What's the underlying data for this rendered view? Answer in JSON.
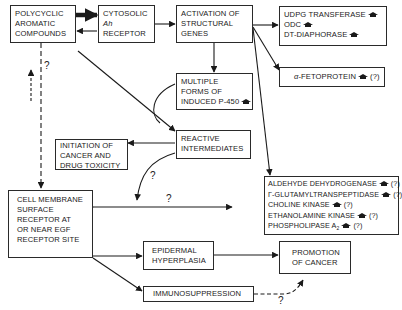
{
  "diagram": {
    "nodes": {
      "pah": {
        "lines": [
          "POLYCYCLIC",
          "AROMATIC",
          "COMPOUNDS"
        ]
      },
      "ah_receptor": {
        "line1": "CYTOSOLIC",
        "line2": "Ah",
        "line3": "RECEPTOR"
      },
      "activation": {
        "lines": [
          "ACTIVATION OF",
          "STRUCTURAL",
          "GENES"
        ]
      },
      "enzymes_top": {
        "items": [
          {
            "label": "UDPG TRANSFERASE",
            "increase": true,
            "uncertain": false
          },
          {
            "label": "ODC",
            "increase": true,
            "uncertain": false
          },
          {
            "label": "DT-DIAPHORASE",
            "increase": true,
            "uncertain": false
          }
        ]
      },
      "fetoprotein": {
        "prefix": "α",
        "label": "-FETOPROTEIN",
        "uncertain_mark": "(?)"
      },
      "p450": {
        "lines": [
          "MULTIPLE",
          "FORMS OF",
          "INDUCED P-450"
        ]
      },
      "reactive": {
        "lines": [
          "REACTIVE",
          "INTERMEDIATES"
        ]
      },
      "initiation": {
        "lines": [
          "INITIATION OF",
          "CANCER AND",
          "DRUG TOXICITY"
        ]
      },
      "enzymes_bottom": {
        "items": [
          {
            "label": "ALDEHYDE DEHYDROGENASE",
            "mark": "(?)"
          },
          {
            "label": "γ-GLUTAMYLTRANSPEPTIDASE",
            "mark": "(?)"
          },
          {
            "label": "CHOLINE KINASE",
            "mark": "(?)"
          },
          {
            "label": "ETHANOLAMINE KINASE",
            "mark": "(?)"
          },
          {
            "label": "PHOSPHOLIPASE A",
            "sub": "2",
            "mark": "(?)"
          }
        ]
      },
      "egf_receptor": {
        "lines": [
          "CELL MEMBRANE",
          "SURFACE",
          "RECEPTOR AT",
          "OR NEAR EGF",
          "RECEPTOR SITE"
        ]
      },
      "hyperplasia": {
        "lines": [
          "EPIDERMAL",
          "HYPERPLASIA"
        ]
      },
      "promotion": {
        "lines": [
          "PROMOTION",
          "OF CANCER"
        ]
      },
      "immunosuppression": {
        "lines": [
          "IMMUNOSUPPRESSION"
        ]
      }
    },
    "edge_labels": {
      "pah_to_membrane": "?",
      "reactive_to_membrane_line": "?",
      "membrane_to_enzymes": "?",
      "immuno_to_promotion": "?"
    },
    "colors": {
      "ink": "#1a1a1a",
      "background": "#ffffff"
    }
  }
}
